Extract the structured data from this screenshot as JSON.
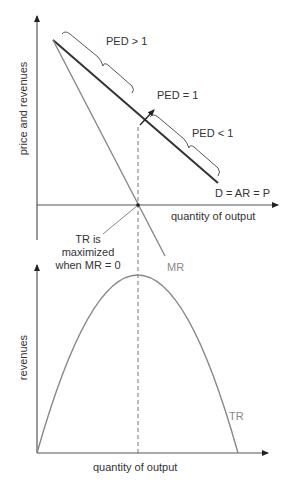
{
  "top_chart": {
    "y_axis_label": "price and revenues",
    "x_axis_label": "quantity of output",
    "curves": {
      "demand_label": "D = AR = P",
      "mr_label": "MR"
    },
    "annotations": {
      "elastic": "PED > 1",
      "unit_elastic": "PED = 1",
      "inelastic": "PED < 1",
      "tr_max_line1": "TR is",
      "tr_max_line2": "maximized",
      "tr_max_line3": "when MR = 0"
    }
  },
  "bottom_chart": {
    "y_axis_label": "revenues",
    "x_axis_label": "quantity of output",
    "curves": {
      "tr_label": "TR"
    }
  },
  "colors": {
    "axis": "#555555",
    "demand": "#333333",
    "mr": "#888888",
    "tr": "#888888",
    "dashed": "#777777",
    "text": "#333333",
    "text_gray": "#888888"
  }
}
